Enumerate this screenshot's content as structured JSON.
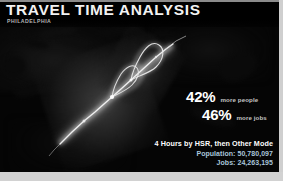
{
  "header": {
    "title": "TRAVEL TIME ANALYSIS",
    "subtitle": "PHILADELPHIA"
  },
  "stats": [
    {
      "value": "42%",
      "label": "more people"
    },
    {
      "value": "46%",
      "label": "more jobs"
    }
  ],
  "scenario": {
    "mode": "4 Hours by HSR, then Other Mode",
    "population_line": "Population: 50,780,097",
    "jobs_line": "Jobs: 24,263,195"
  },
  "map": {
    "basemap_label": "dark-basemap",
    "corridor_label": "high-speed-rail-accessibility-corridor"
  },
  "colors": {
    "background": "#050505",
    "title_text": "#f2f2f2",
    "subtitle_text": "#b6b6b6",
    "stat_value": "#ffffff",
    "stat_label": "#c4c4c4",
    "scenario_mode": "#ffffff",
    "scenario_metric": "#a9c6dc",
    "corridor_glow": "#ffffff",
    "frame_strip": "#d2d2d2"
  }
}
